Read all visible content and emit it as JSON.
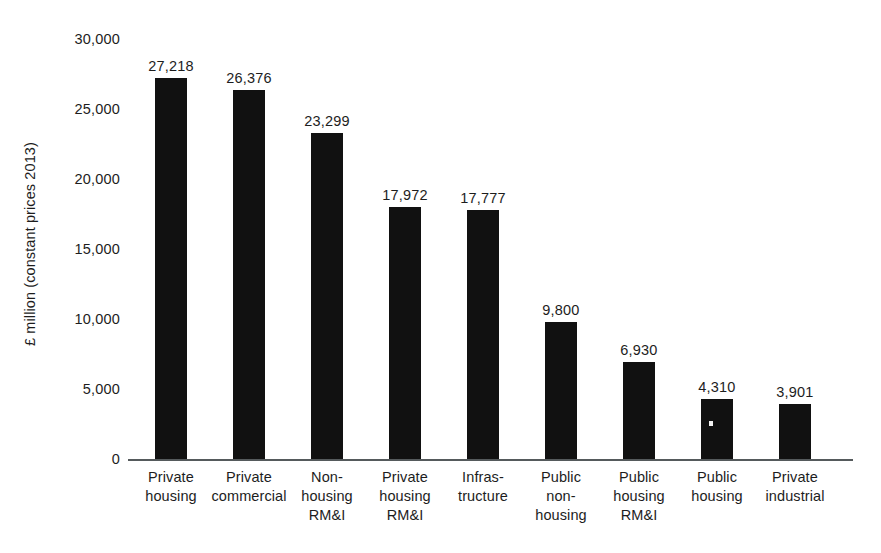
{
  "chart_data": {
    "type": "bar",
    "title": "",
    "subtitle": "",
    "xlabel": "",
    "ylabel": "£ million (constant prices 2013)",
    "ylim": [
      0,
      30000
    ],
    "ytick_labels": [
      "30,000",
      "25,000",
      "20,000",
      "15,000",
      "10,000",
      "5,000",
      "0"
    ],
    "yticks": [
      30000,
      25000,
      20000,
      15000,
      10000,
      5000,
      0
    ],
    "grid": false,
    "legend": null,
    "orientation": "vertical",
    "bar_color": "#111111",
    "categories": [
      "Private housing",
      "Private commercial",
      "Non-housing RM&I",
      "Private housing RM&I",
      "Infrastructure",
      "Public non-housing",
      "Public housing RM&I",
      "Public housing",
      "Private industrial"
    ],
    "category_label_lines": [
      [
        "Private",
        "housing"
      ],
      [
        "Private",
        "commercial"
      ],
      [
        "Non-",
        "housing",
        "RM&I"
      ],
      [
        "Private",
        "housing",
        "RM&I"
      ],
      [
        "Infras-",
        "tructure"
      ],
      [
        "Public",
        "non-",
        "housing"
      ],
      [
        "Public",
        "housing",
        "RM&I"
      ],
      [
        "Public",
        "housing"
      ],
      [
        "Private",
        "industrial"
      ]
    ],
    "values": [
      27218,
      26376,
      23299,
      17972,
      17777,
      9800,
      6930,
      4310,
      3901
    ],
    "value_labels": [
      "27,218",
      "26,376",
      "23,299",
      "17,972",
      "17,777",
      "9,800",
      "6,930",
      "4,310",
      "3,901"
    ]
  },
  "colors": {
    "bar": "#111111",
    "axis": "#555a5c",
    "text": "#1d1d1d",
    "background": "#ffffff"
  }
}
